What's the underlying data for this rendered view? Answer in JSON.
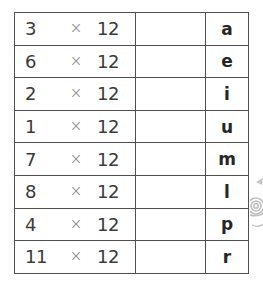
{
  "page": {
    "background_color": "#ffffff",
    "type": "math-worksheet-table"
  },
  "table": {
    "border_color": "#4f4f4f",
    "cell_background": "#ffffff",
    "times_symbol": "×",
    "columns": [
      {
        "key": "problem",
        "header": "",
        "align": "left"
      },
      {
        "key": "answer",
        "header": "",
        "align": "center"
      },
      {
        "key": "letter",
        "header": "",
        "align": "center"
      }
    ],
    "rows": [
      {
        "factor_a": "3",
        "operator": "×",
        "factor_b": "12",
        "answer": "",
        "letter": "a"
      },
      {
        "factor_a": "6",
        "operator": "×",
        "factor_b": "12",
        "answer": "",
        "letter": "e"
      },
      {
        "factor_a": "2",
        "operator": "×",
        "factor_b": "12",
        "answer": "",
        "letter": "i"
      },
      {
        "factor_a": "1",
        "operator": "×",
        "factor_b": "12",
        "answer": "",
        "letter": "u"
      },
      {
        "factor_a": "7",
        "operator": "×",
        "factor_b": "12",
        "answer": "",
        "letter": "m"
      },
      {
        "factor_a": "8",
        "operator": "×",
        "factor_b": "12",
        "answer": "",
        "letter": "l"
      },
      {
        "factor_a": "4",
        "operator": "×",
        "factor_b": "12",
        "answer": "",
        "letter": "p"
      },
      {
        "factor_a": "11",
        "operator": "×",
        "factor_b": "12",
        "answer": "",
        "letter": "r"
      }
    ]
  },
  "decoration": {
    "edge_clipart": {
      "name": "snail-clipart",
      "clipped": true,
      "color": "#8a8a8a"
    }
  }
}
